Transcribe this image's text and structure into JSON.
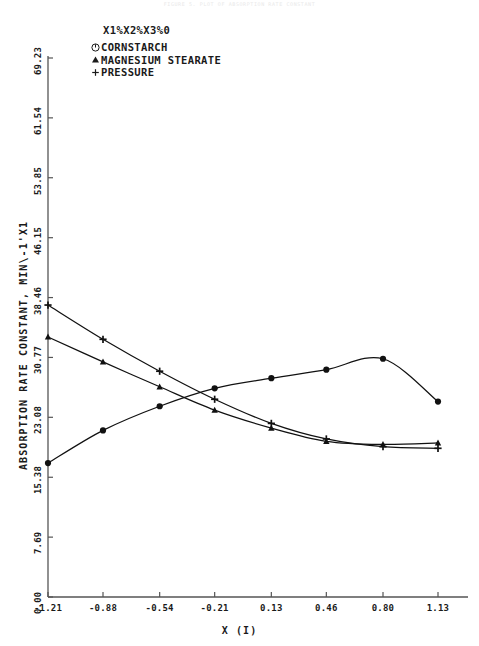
{
  "header": {
    "faint_text": "FIGURE 5. PLOT OF ABSORPTION RATE CONSTANT"
  },
  "legend": {
    "title": "X1%X2%X3%0",
    "items": [
      {
        "marker": "circle-dot-icon",
        "label": "CORNSTARCH"
      },
      {
        "marker": "filled-triangle-icon",
        "label": "MAGNESIUM STEARATE"
      },
      {
        "marker": "plus-icon",
        "label": "PRESSURE"
      }
    ]
  },
  "axes": {
    "y_label": "ABSORPTION RATE CONSTANT, MIN\\-1'X1",
    "x_label": "X (I)",
    "y_ticks": [
      "0.00",
      "7.69",
      "15.38",
      "23.08",
      "30.77",
      "38.46",
      "46.15",
      "53.85",
      "61.54",
      "69.23"
    ],
    "x_ticks": [
      "-1.21",
      "-0.88",
      "-0.54",
      "-0.21",
      "0.13",
      "0.46",
      "0.80",
      "1.13"
    ]
  },
  "chart_data": {
    "type": "line",
    "title": "",
    "xlabel": "X (I)",
    "ylabel": "ABSORPTION RATE CONSTANT, MIN\\-1'X1",
    "xlim": [
      -1.21,
      1.13
    ],
    "ylim": [
      0.0,
      69.23
    ],
    "grid": false,
    "legend_position": "top-left",
    "x": [
      -1.21,
      -0.88,
      -0.54,
      -0.21,
      0.13,
      0.46,
      0.8,
      1.13
    ],
    "series": [
      {
        "name": "CORNSTARCH",
        "marker": "circle",
        "values": [
          17.2,
          21.4,
          24.5,
          26.8,
          28.1,
          29.2,
          30.6,
          25.1
        ]
      },
      {
        "name": "MAGNESIUM STEARATE",
        "marker": "triangle",
        "values": [
          33.4,
          30.2,
          27.0,
          24.0,
          21.7,
          20.0,
          19.6,
          19.8
        ]
      },
      {
        "name": "PRESSURE",
        "marker": "plus",
        "values": [
          37.5,
          33.1,
          29.0,
          25.4,
          22.3,
          20.3,
          19.3,
          19.1
        ]
      }
    ]
  }
}
